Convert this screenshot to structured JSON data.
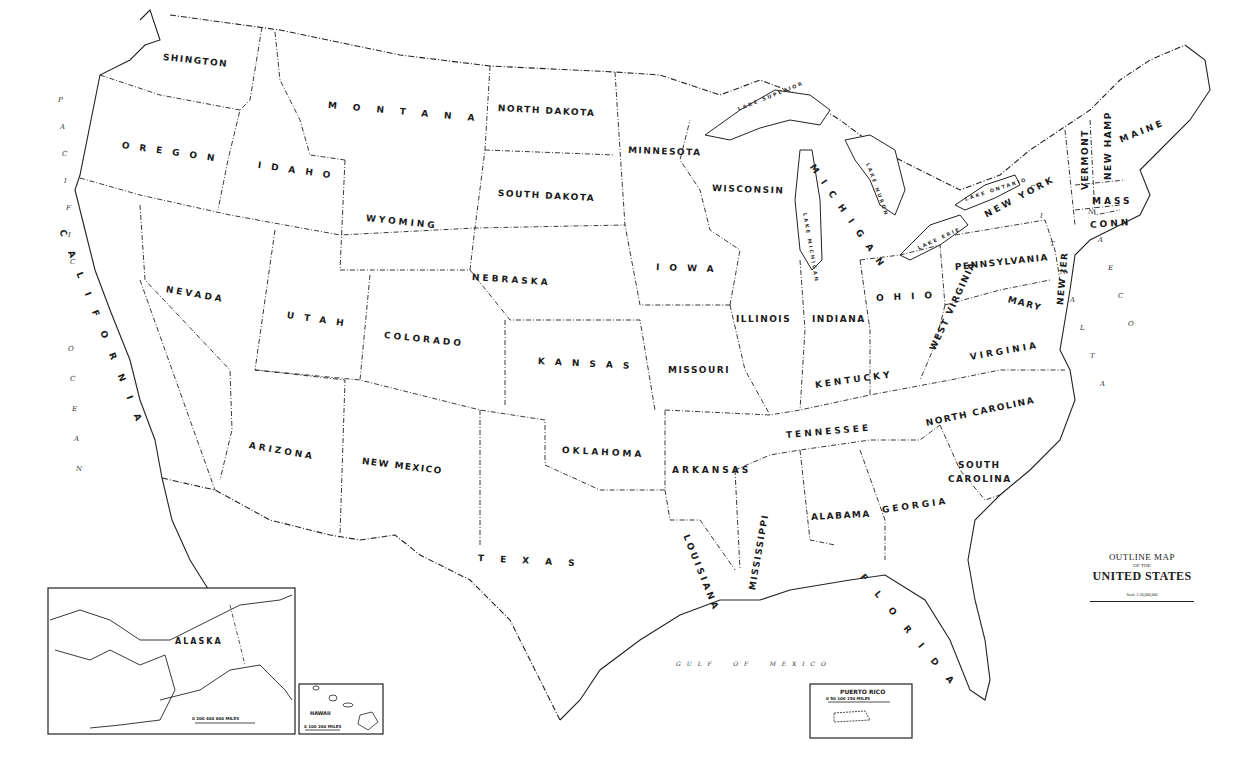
{
  "title": {
    "line1": "OUTLINE MAP",
    "line2": "OF THE",
    "line3": "UNITED STATES",
    "scale_text": "Scale 1:30,000,000"
  },
  "states": [
    {
      "id": "washington",
      "label": "SHINGTON",
      "x": 163,
      "y": 52,
      "rot": 6,
      "style": "tight"
    },
    {
      "id": "oregon",
      "label": "OREGON",
      "x": 122,
      "y": 140,
      "rot": 8,
      "style": "wide"
    },
    {
      "id": "idaho",
      "label": "IDAHO",
      "x": 258,
      "y": 160,
      "rot": 8,
      "style": "wide"
    },
    {
      "id": "montana",
      "label": "MONTANA",
      "x": 328,
      "y": 100,
      "rot": 5,
      "style": "xwide"
    },
    {
      "id": "north-dakota",
      "label": "NORTH DAKOTA",
      "x": 498,
      "y": 103,
      "rot": 3,
      "style": "tight"
    },
    {
      "id": "minnesota",
      "label": "MINNESOTA",
      "x": 628,
      "y": 145,
      "rot": 2,
      "style": "tight"
    },
    {
      "id": "wisconsin",
      "label": "WISCONSIN",
      "x": 712,
      "y": 183,
      "rot": 2,
      "style": "tight"
    },
    {
      "id": "michigan",
      "label": "MICHIGAN",
      "x": 812,
      "y": 160,
      "rot": 55,
      "style": "wide"
    },
    {
      "id": "new-york",
      "label": "NEW YORK",
      "x": 985,
      "y": 210,
      "rot": -28,
      "style": ""
    },
    {
      "id": "vermont",
      "label": "VERMONT",
      "x": 1085,
      "y": 185,
      "rot": -90,
      "style": "tight"
    },
    {
      "id": "new-hampshire",
      "label": "NEW HAMP",
      "x": 1108,
      "y": 175,
      "rot": -90,
      "style": "tight"
    },
    {
      "id": "maine",
      "label": "MAINE",
      "x": 1120,
      "y": 135,
      "rot": -22,
      "style": ""
    },
    {
      "id": "massachusetts",
      "label": "MASS",
      "x": 1092,
      "y": 196,
      "rot": 0,
      "style": ""
    },
    {
      "id": "connecticut",
      "label": "CONN",
      "x": 1090,
      "y": 220,
      "rot": -4,
      "style": ""
    },
    {
      "id": "wyoming",
      "label": "WYOMING",
      "x": 366,
      "y": 213,
      "rot": 6,
      "style": ""
    },
    {
      "id": "south-dakota",
      "label": "SOUTH DAKOTA",
      "x": 498,
      "y": 188,
      "rot": 3,
      "style": "tight"
    },
    {
      "id": "iowa",
      "label": "IOWA",
      "x": 656,
      "y": 262,
      "rot": 2,
      "style": "wide"
    },
    {
      "id": "nebraska",
      "label": "NEBRASKA",
      "x": 472,
      "y": 272,
      "rot": 4,
      "style": ""
    },
    {
      "id": "pennsylvania",
      "label": "PENNSYLVANIA",
      "x": 955,
      "y": 262,
      "rot": -6,
      "style": "tight"
    },
    {
      "id": "new-jersey",
      "label": "NEW JER",
      "x": 1060,
      "y": 300,
      "rot": -85,
      "style": "tight"
    },
    {
      "id": "california",
      "label": "CALIFORNIA",
      "x": 62,
      "y": 225,
      "rot": 68,
      "style": "xwide"
    },
    {
      "id": "nevada",
      "label": "NEVADA",
      "x": 166,
      "y": 284,
      "rot": 10,
      "style": ""
    },
    {
      "id": "utah",
      "label": "UTAH",
      "x": 287,
      "y": 310,
      "rot": 8,
      "style": "wide"
    },
    {
      "id": "colorado",
      "label": "COLORADO",
      "x": 384,
      "y": 330,
      "rot": 6,
      "style": ""
    },
    {
      "id": "kansas",
      "label": "KANSAS",
      "x": 538,
      "y": 356,
      "rot": 3,
      "style": "wide"
    },
    {
      "id": "missouri",
      "label": "MISSOURI",
      "x": 668,
      "y": 365,
      "rot": 0,
      "style": "tight"
    },
    {
      "id": "illinois",
      "label": "ILLINOIS",
      "x": 736,
      "y": 314,
      "rot": 0,
      "style": "tight"
    },
    {
      "id": "indiana",
      "label": "INDIANA",
      "x": 812,
      "y": 314,
      "rot": 0,
      "style": "tight"
    },
    {
      "id": "ohio",
      "label": "OHIO",
      "x": 876,
      "y": 293,
      "rot": -3,
      "style": "wide"
    },
    {
      "id": "west-virginia",
      "label": "WEST VIRGINIA",
      "x": 932,
      "y": 345,
      "rot": -65,
      "style": "tight"
    },
    {
      "id": "maryland",
      "label": "MARY",
      "x": 1008,
      "y": 294,
      "rot": 15,
      "style": "tight"
    },
    {
      "id": "virginia",
      "label": "VIRGINIA",
      "x": 970,
      "y": 352,
      "rot": -10,
      "style": ""
    },
    {
      "id": "kentucky",
      "label": "KENTUCKY",
      "x": 815,
      "y": 380,
      "rot": -8,
      "style": ""
    },
    {
      "id": "arizona",
      "label": "ARIZONA",
      "x": 249,
      "y": 440,
      "rot": 10,
      "style": ""
    },
    {
      "id": "new-mexico",
      "label": "NEW MEXICO",
      "x": 362,
      "y": 456,
      "rot": 7,
      "style": "tight"
    },
    {
      "id": "oklahoma",
      "label": "OKLAHOMA",
      "x": 562,
      "y": 445,
      "rot": 3,
      "style": ""
    },
    {
      "id": "arkansas",
      "label": "ARKANSAS",
      "x": 672,
      "y": 465,
      "rot": 0,
      "style": ""
    },
    {
      "id": "tennessee",
      "label": "TENNESSEE",
      "x": 786,
      "y": 430,
      "rot": -5,
      "style": ""
    },
    {
      "id": "north-carolina",
      "label": "NORTH CAROLINA",
      "x": 926,
      "y": 418,
      "rot": -12,
      "style": "tight"
    },
    {
      "id": "south-carolina",
      "label": "SOUTH",
      "x": 958,
      "y": 460,
      "rot": 0,
      "style": "tight"
    },
    {
      "id": "south-carolina-2",
      "label": "CAROLINA",
      "x": 948,
      "y": 474,
      "rot": 0,
      "style": "tight"
    },
    {
      "id": "texas",
      "label": "TEXAS",
      "x": 478,
      "y": 553,
      "rot": 3,
      "style": "xwide"
    },
    {
      "id": "louisiana",
      "label": "LOUISIANA",
      "x": 686,
      "y": 530,
      "rot": 68,
      "style": ""
    },
    {
      "id": "mississippi",
      "label": "MISSISSIPPI",
      "x": 752,
      "y": 585,
      "rot": -80,
      "style": "tight"
    },
    {
      "id": "alabama",
      "label": "ALABAMA",
      "x": 811,
      "y": 512,
      "rot": -3,
      "style": "tight"
    },
    {
      "id": "georgia",
      "label": "GEORGIA",
      "x": 882,
      "y": 505,
      "rot": -8,
      "style": ""
    },
    {
      "id": "florida",
      "label": "FLORIDA",
      "x": 862,
      "y": 570,
      "rot": 50,
      "style": "xwide"
    }
  ],
  "lakes": [
    {
      "label": "LAKE SUPERIOR",
      "x": 738,
      "y": 106,
      "rot": -22
    },
    {
      "label": "LAKE MICHIGAN",
      "x": 805,
      "y": 210,
      "rot": 80
    },
    {
      "label": "LAKE HURON",
      "x": 868,
      "y": 160,
      "rot": 70
    },
    {
      "label": "LAKE ONTARIO",
      "x": 965,
      "y": 196,
      "rot": -18
    },
    {
      "label": "LAKE ERIE",
      "x": 918,
      "y": 245,
      "rot": -25
    }
  ],
  "oceans": {
    "pacific": {
      "label": "PACIFIC",
      "letters": [
        "P",
        "A",
        "C",
        "I",
        "F",
        "I",
        "C"
      ],
      "x": 58,
      "y": 96,
      "dy": 27
    },
    "pacific_ocean": {
      "letters": [
        "O",
        "C",
        "E",
        "A",
        "N"
      ],
      "x": 68,
      "y": 345,
      "dy": 30
    },
    "atlantic": {
      "letters": [
        "A",
        "T",
        "L",
        "A",
        "N",
        "T",
        "I",
        "C"
      ],
      "x": 1100,
      "y": 380,
      "dy": -28
    },
    "atlantic_ocean": {
      "letters": [
        "O",
        "C",
        "E",
        "A",
        "N"
      ],
      "x": 1128,
      "y": 320,
      "dy": -28
    },
    "gulf": {
      "label": "G U L F     O F     M E X I C O",
      "x": 676,
      "y": 660
    }
  },
  "insets": {
    "alaska": {
      "label": "ALASKA",
      "scale": "0   200   400   600 MILES"
    },
    "hawaii": {
      "label": "HAWAII",
      "scale": "0   100   200 MILES"
    },
    "puerto_rico": {
      "label": "PUERTO RICO",
      "scale": "0   50   100   150 MILES"
    }
  }
}
